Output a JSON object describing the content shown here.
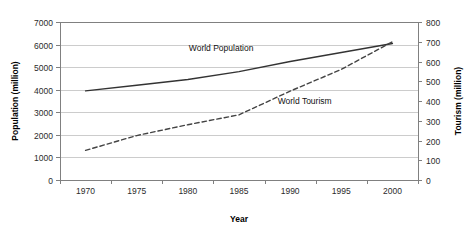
{
  "chart_data": {
    "type": "line",
    "title": "",
    "xlabel": "Year",
    "ylabel": "Population (million)",
    "y2label": "Tourism (million)",
    "x": [
      1970,
      1975,
      1980,
      1985,
      1990,
      1995,
      2000
    ],
    "xlim": [
      1970,
      2000
    ],
    "ylim": [
      0,
      7000
    ],
    "y2lim": [
      0,
      800
    ],
    "ytick_labels": [
      "0",
      "1000",
      "2000",
      "3000",
      "4000",
      "5000",
      "6000",
      "7000"
    ],
    "yticks": [
      0,
      1000,
      2000,
      3000,
      4000,
      5000,
      6000,
      7000
    ],
    "y2tick_labels": [
      "0",
      "100",
      "200",
      "300",
      "400",
      "500",
      "600",
      "700",
      "800"
    ],
    "y2ticks": [
      0,
      100,
      200,
      300,
      400,
      500,
      600,
      700,
      800
    ],
    "xtick_labels": [
      "1970",
      "1975",
      "1980",
      "1985",
      "1990",
      "1995",
      "2000"
    ],
    "grid": "horizontal",
    "legend_position": "inline-annotations",
    "series": [
      {
        "name": "World Population",
        "axis": "left",
        "style": "solid",
        "color": "#333333",
        "label_x": 1983.5,
        "label_y": 5700,
        "values": [
          3950,
          4200,
          4450,
          4800,
          5250,
          5650,
          6050
        ]
      },
      {
        "name": "World Tourism",
        "axis": "right",
        "style": "dashed",
        "color": "#444444",
        "label_x": 1990.5,
        "label_y": 385,
        "values": [
          150,
          225,
          280,
          330,
          450,
          560,
          700
        ]
      }
    ]
  },
  "annotations": {
    "world_population_label": "World Population",
    "world_tourism_label": "World Tourism"
  },
  "axes": {
    "x_title": "Year",
    "y_left_title": "Population (million)",
    "y_right_title": "Tourism (million)"
  },
  "colors": {
    "plot_background": "#ffffff",
    "frame": "#808080",
    "gridline": "#bfbfbf",
    "population_line": "#333333",
    "tourism_line": "#444444",
    "text": "#1a1a1a"
  }
}
